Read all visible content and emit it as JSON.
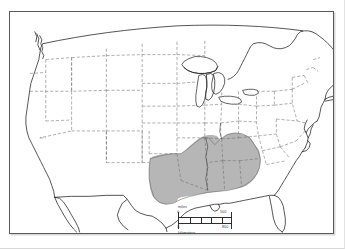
{
  "map": {
    "title": "Map of the contiguous United States",
    "region_name": "United States (lower 48 states)",
    "projection_note": "conic projection with curved northern national border",
    "background_color": "#ffffff",
    "frame_color": "#555a5e",
    "coastline_color": "#1d1d1d",
    "state_boundary_color": "#6d6d6d",
    "state_boundary_style": "dashed",
    "highlight": {
      "name": "shaded-region",
      "fill_color": "#b6b6b6",
      "outline_color": "#6a6a6a",
      "description": "Shaded south-central and southeastern states",
      "states_shaded": [
        "Eastern Texas",
        "Oklahoma",
        "Arkansas",
        "Louisiana",
        "Mississippi",
        "Alabama",
        "Georgia",
        "Tennessee",
        "Kentucky",
        "Southern Missouri",
        "Southern Illinois",
        "Southern Indiana",
        "Western South Carolina"
      ],
      "states_not_shaded": [
        "Florida",
        "North Carolina",
        "Virginia",
        "Kansas",
        "Western Texas"
      ]
    },
    "features_shown": [
      "Great Lakes",
      "Gulf of Mexico coastline",
      "Atlantic coastline",
      "Pacific coastline",
      "Florida peninsula",
      "Chesapeake Bay",
      "Long Island",
      "Cape Cod",
      "Puget Sound",
      "Baja California",
      "Great Salt Lake"
    ]
  },
  "scale_bar": {
    "name": "dual-unit-scale-bar",
    "miles_label": "miles",
    "kilometers_label": "kilometers",
    "miles_min": "0",
    "miles_max": "500",
    "kilometers_min": "0",
    "kilometers_max": "800",
    "segments": 5,
    "bar_color": "#2e2e2e"
  }
}
